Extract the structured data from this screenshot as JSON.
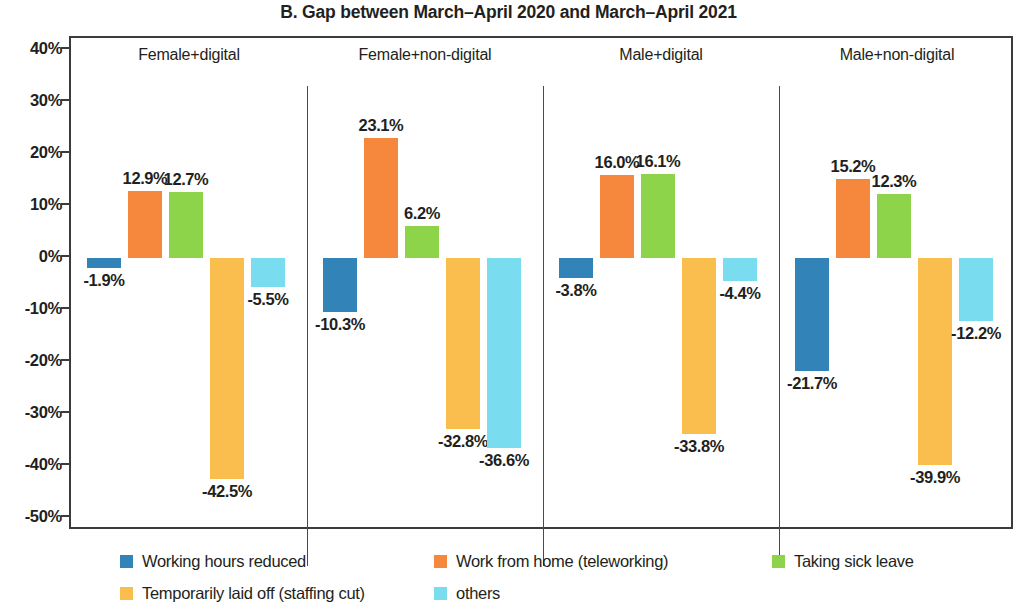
{
  "chart_data": {
    "type": "bar",
    "title": "B. Gap between March–April 2020 and March–April 2021",
    "xlabel": "",
    "ylabel": "",
    "ylim": [
      -50,
      40
    ],
    "ytick_labels": [
      "40%",
      "30%",
      "20%",
      "10%",
      "0%",
      "-10%",
      "-20%",
      "-30%",
      "-40%",
      "-50%"
    ],
    "ytick_values": [
      40,
      30,
      20,
      10,
      0,
      -10,
      -20,
      -30,
      -40,
      -50
    ],
    "grid": false,
    "legend_position": "bottom",
    "value_format": "percent",
    "panels": [
      "Female+digital",
      "Female+non-digital",
      "Male+digital",
      "Male+non-digital"
    ],
    "categories": [
      "Female+digital",
      "Female+non-digital",
      "Male+digital",
      "Male+non-digital"
    ],
    "series": [
      {
        "name": "Working hours reduced",
        "color": "#3283b8",
        "values": [
          -1.9,
          -10.3,
          -3.8,
          -21.7
        ],
        "labels": [
          "-1.9%",
          "-10.3%",
          "-3.8%",
          "-21.7%"
        ]
      },
      {
        "name": "Work from home (teleworking)",
        "color": "#f5883c",
        "values": [
          12.9,
          23.1,
          16.0,
          15.2
        ],
        "labels": [
          "12.9%",
          "23.1%",
          "16.0%",
          "15.2%"
        ]
      },
      {
        "name": "Taking sick leave",
        "color": "#8dd44a",
        "values": [
          12.7,
          6.2,
          16.1,
          12.3
        ],
        "labels": [
          "12.7%",
          "6.2%",
          "16.1%",
          "12.3%"
        ]
      },
      {
        "name": "Temporarily laid off (staffing cut)",
        "color": "#f9be4d",
        "values": [
          -42.5,
          -32.8,
          -33.8,
          -39.9
        ],
        "labels": [
          "-42.5%",
          "-32.8%",
          "-33.8%",
          "-39.9%"
        ]
      },
      {
        "name": "others",
        "color": "#79dcef",
        "values": [
          -5.5,
          -36.6,
          -4.4,
          -12.2
        ],
        "labels": [
          "-5.5%",
          "-36.6%",
          "-4.4%",
          "-12.2%"
        ]
      }
    ]
  },
  "legend": {
    "items": [
      {
        "label": "Working hours reduced",
        "color": "#3283b8"
      },
      {
        "label": "Work from home (teleworking)",
        "color": "#f5883c"
      },
      {
        "label": "Taking sick leave",
        "color": "#8dd44a"
      },
      {
        "label": "Temporarily laid off (staffing cut)",
        "color": "#f9be4d"
      },
      {
        "label": "others",
        "color": "#79dcef"
      }
    ]
  }
}
